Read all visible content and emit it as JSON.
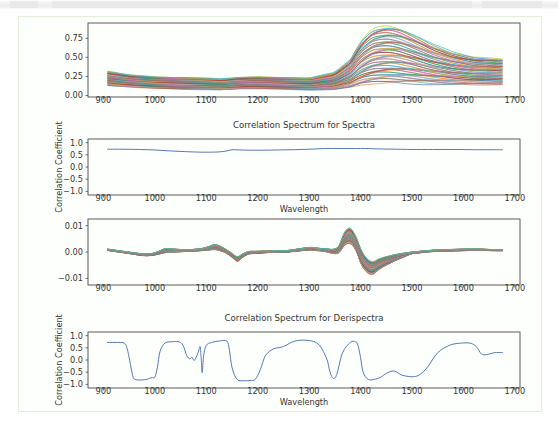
{
  "page": {
    "background": "#ffffff",
    "cell_border_color": "#e1efd8",
    "cell_background": "#fdfffc"
  },
  "charts": [
    {
      "id": "spectra-plot",
      "name": "raw-spectra-chart",
      "chart_data": {
        "type": "line",
        "title": "",
        "xlabel": "",
        "ylabel": "",
        "xlim": [
          870,
          1710
        ],
        "ylim": [
          -0.02,
          0.95
        ],
        "xticks": [
          900,
          1000,
          1100,
          1200,
          1300,
          1400,
          1500,
          1600,
          1700
        ],
        "yticks": [
          0.0,
          0.25,
          0.5,
          0.75
        ],
        "ytick_labels": [
          "0.00",
          "0.25",
          "0.50",
          "0.75"
        ],
        "grid": false,
        "legend": "none",
        "n_series": 60,
        "description": "Overlaid NIR absorbance spectra, 908-1676 nm, broad peak near 1450 nm",
        "x": [
          908,
          950,
          1000,
          1050,
          1100,
          1130,
          1160,
          1200,
          1250,
          1300,
          1350,
          1380,
          1400,
          1420,
          1440,
          1460,
          1480,
          1500,
          1540,
          1580,
          1620,
          1676
        ],
        "series_envelope_low": [
          0.13,
          0.11,
          0.095,
          0.085,
          0.08,
          0.075,
          0.085,
          0.09,
          0.085,
          0.075,
          0.08,
          0.105,
          0.14,
          0.16,
          0.17,
          0.175,
          0.172,
          0.168,
          0.155,
          0.145,
          0.14,
          0.145
        ],
        "series_envelope_high": [
          0.315,
          0.27,
          0.245,
          0.235,
          0.225,
          0.215,
          0.235,
          0.245,
          0.235,
          0.225,
          0.3,
          0.47,
          0.7,
          0.85,
          0.9,
          0.905,
          0.865,
          0.8,
          0.66,
          0.56,
          0.5,
          0.475
        ]
      }
    },
    {
      "id": "corr-spectra-plot",
      "name": "correlation-spectrum-for-spectra-chart",
      "chart_data": {
        "type": "line",
        "title": "Correlation Spectrum for Spectra",
        "xlabel": "Wavelength",
        "ylabel": "Correlation Coefficient",
        "xlim": [
          870,
          1710
        ],
        "ylim": [
          -1.15,
          1.15
        ],
        "xticks": [
          900,
          1000,
          1100,
          1200,
          1300,
          1400,
          1500,
          1600,
          1700
        ],
        "yticks": [
          -1.0,
          -0.5,
          0.0,
          0.5,
          1.0
        ],
        "ytick_labels": [
          "-1.0",
          "-0.5",
          "0.0",
          "0.5",
          "1.0"
        ],
        "grid": false,
        "legend": "none",
        "line_color": "#4c72b0",
        "x": [
          908,
          940,
          970,
          1000,
          1030,
          1060,
          1090,
          1110,
          1125,
          1140,
          1150,
          1165,
          1185,
          1210,
          1240,
          1270,
          1300,
          1330,
          1360,
          1390,
          1410,
          1440,
          1470,
          1500,
          1540,
          1580,
          1620,
          1660,
          1676
        ],
        "values": [
          0.73,
          0.73,
          0.72,
          0.7,
          0.66,
          0.63,
          0.61,
          0.61,
          0.62,
          0.66,
          0.71,
          0.7,
          0.69,
          0.69,
          0.7,
          0.71,
          0.73,
          0.76,
          0.76,
          0.76,
          0.76,
          0.74,
          0.73,
          0.72,
          0.72,
          0.72,
          0.71,
          0.71,
          0.71
        ]
      }
    },
    {
      "id": "derispectra-plot",
      "name": "derivative-spectra-chart",
      "chart_data": {
        "type": "line",
        "title": "",
        "xlabel": "",
        "ylabel": "",
        "xlim": [
          870,
          1710
        ],
        "ylim": [
          -0.0125,
          0.0125
        ],
        "xticks": [
          900,
          1000,
          1100,
          1200,
          1300,
          1400,
          1500,
          1600,
          1700
        ],
        "yticks": [
          -0.01,
          0.0,
          0.01
        ],
        "ytick_labels": [
          "-0.01",
          "0.00",
          "0.01"
        ],
        "grid": false,
        "legend": "none",
        "n_series": 60,
        "description": "Overlaid first-derivative spectra with strong +0.010 peak at 1375 nm and -0.009 trough at 1410 nm",
        "x": [
          908,
          940,
          980,
          1000,
          1020,
          1060,
          1090,
          1120,
          1140,
          1160,
          1180,
          1220,
          1260,
          1300,
          1330,
          1355,
          1375,
          1390,
          1405,
          1420,
          1440,
          1470,
          1500,
          1540,
          1580,
          1620,
          1660,
          1676
        ],
        "series_envelope_low": [
          0.0006,
          -0.0003,
          -0.0015,
          -0.0012,
          -0.0002,
          0.0002,
          0.0005,
          0.001,
          -0.0005,
          -0.0035,
          -0.0008,
          -0.0002,
          0.0,
          0.0008,
          0.0003,
          -0.001,
          0.004,
          0.001,
          -0.0065,
          -0.009,
          -0.006,
          -0.003,
          -0.0006,
          0.0002,
          0.0004,
          0.0006,
          0.0005,
          0.0005
        ],
        "series_envelope_high": [
          0.0011,
          0.0002,
          -0.0008,
          -0.0004,
          0.0014,
          0.0008,
          0.0012,
          0.003,
          0.0008,
          -0.0018,
          0.0002,
          0.0004,
          0.0006,
          0.0018,
          0.0012,
          0.001,
          0.0103,
          0.0062,
          -0.001,
          -0.004,
          -0.0022,
          -0.0008,
          0.0,
          0.0007,
          0.001,
          0.0012,
          0.0009,
          0.0008
        ]
      }
    },
    {
      "id": "corr-derispectra-plot",
      "name": "correlation-spectrum-for-derispectra-chart",
      "chart_data": {
        "type": "line",
        "title": "Correlation Spectrum for Derispectra",
        "xlabel": "Wavelength",
        "ylabel": "Correlation Coefficient",
        "xlim": [
          870,
          1710
        ],
        "ylim": [
          -1.15,
          1.15
        ],
        "xticks": [
          900,
          1000,
          1100,
          1200,
          1300,
          1400,
          1500,
          1600,
          1700
        ],
        "yticks": [
          -1.0,
          -0.5,
          0.0,
          0.5,
          1.0
        ],
        "ytick_labels": [
          "-1.0",
          "-0.5",
          "0.0",
          "0.5",
          "1.0"
        ],
        "grid": false,
        "legend": "none",
        "line_color": "#4c72b0",
        "x": [
          908,
          930,
          940,
          945,
          950,
          955,
          960,
          975,
          985,
          990,
          995,
          1000,
          1005,
          1010,
          1020,
          1035,
          1042,
          1048,
          1055,
          1062,
          1068,
          1072,
          1076,
          1080,
          1084,
          1088,
          1090,
          1092,
          1095,
          1100,
          1110,
          1125,
          1140,
          1145,
          1150,
          1160,
          1175,
          1185,
          1195,
          1205,
          1215,
          1230,
          1245,
          1255,
          1265,
          1280,
          1300,
          1315,
          1325,
          1335,
          1340,
          1345,
          1350,
          1355,
          1365,
          1380,
          1390,
          1395,
          1400,
          1405,
          1415,
          1430,
          1440,
          1450,
          1465,
          1480,
          1495,
          1505,
          1515,
          1530,
          1550,
          1575,
          1600,
          1615,
          1625,
          1635,
          1645,
          1660,
          1676
        ],
        "values": [
          0.72,
          0.72,
          0.7,
          0.55,
          0.1,
          -0.45,
          -0.78,
          -0.82,
          -0.79,
          -0.75,
          -0.72,
          -0.7,
          -0.3,
          0.35,
          0.7,
          0.75,
          0.76,
          0.74,
          0.6,
          0.18,
          0.05,
          0.12,
          -0.02,
          0.1,
          0.3,
          0.55,
          0.1,
          -0.52,
          0.2,
          0.6,
          0.72,
          0.78,
          0.78,
          0.4,
          -0.3,
          -0.8,
          -0.85,
          -0.84,
          -0.8,
          -0.4,
          0.18,
          0.45,
          0.52,
          0.6,
          0.72,
          0.81,
          0.8,
          0.7,
          0.45,
          0.0,
          -0.45,
          -0.72,
          -0.74,
          -0.5,
          0.3,
          0.72,
          0.75,
          0.6,
          0.1,
          -0.5,
          -0.8,
          -0.78,
          -0.7,
          -0.55,
          -0.45,
          -0.62,
          -0.68,
          -0.68,
          -0.6,
          -0.3,
          0.3,
          0.62,
          0.7,
          0.68,
          0.55,
          0.25,
          0.22,
          0.3,
          0.3
        ]
      }
    }
  ],
  "labels": {
    "wavelength": "Wavelength",
    "correlation_coefficient": "Correlation Coefficient",
    "title_spectra": "Correlation Spectrum for Spectra",
    "title_derispectra": "Correlation Spectrum for Derispectra"
  }
}
